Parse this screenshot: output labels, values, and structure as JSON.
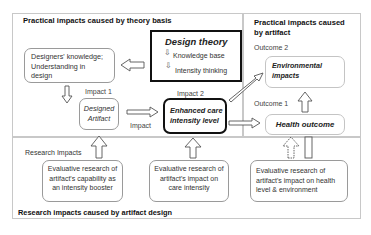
{
  "sections": {
    "theory": "Practical impacts caused by theory basis",
    "artifact": "Practical impacts caused by artifact",
    "research_label": "Research Impacts",
    "research_footer": "Research impacts caused by artifact design"
  },
  "nodes": {
    "design_theory": {
      "title": "Design theory",
      "item1": "Knowledge base",
      "item2": "Intensity thinking"
    },
    "designers_knowledge": {
      "line1": "Designers' knowledge;",
      "line2": "Understanding in",
      "line3": "design"
    },
    "designed_artifact": {
      "line1": "Designed",
      "line2": "Artifact"
    },
    "enhanced_care": {
      "line1": "Enhanced care",
      "line2": "intensity level"
    },
    "environmental": {
      "line1": "Environmental",
      "line2": "impacts"
    },
    "health_outcome": {
      "label": "Health outcome"
    },
    "research1": {
      "line1": "Evaluative research of",
      "line2": "artifact's capability as",
      "line3": "an intensity booster"
    },
    "research2": {
      "line1": "Evaluative research of",
      "line2": "artifact's impact on",
      "line3": "care intensity"
    },
    "research3": {
      "line1": "Evaluative research of",
      "line2": "artifact's impact on health",
      "line3": "level & environment"
    }
  },
  "labels": {
    "impact1": "Impact 1",
    "impact2": "Impact 2",
    "impact": "Impact",
    "outcome1": "Outcome 1",
    "outcome2": "Outcome 2"
  }
}
